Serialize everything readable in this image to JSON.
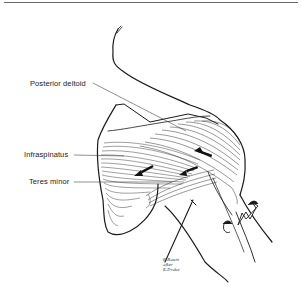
{
  "figure": {
    "labels": {
      "posterior_deltoid": "Posterior deltoid",
      "infraspinatus": "Infraspinatus",
      "teres_minor": "Teres minor"
    },
    "signature": [
      "K.Baum",
      "after",
      "K.Drake"
    ],
    "colors": {
      "ink": "#1a1a1a",
      "background": "#ffffff",
      "rule": "#6a6a6a"
    }
  }
}
